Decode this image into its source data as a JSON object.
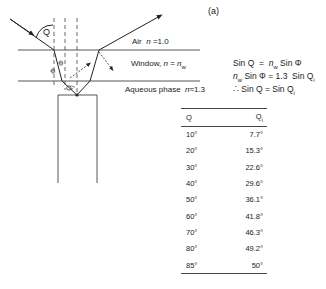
{
  "figure": {
    "panel_label": "(a)",
    "layers": [
      {
        "name": "air",
        "label": "Air  n = 1.0"
      },
      {
        "name": "window",
        "label": "Window,  n = n_w"
      },
      {
        "name": "aqueous",
        "label": "Aqueous phase  n ≈ 1.3"
      }
    ],
    "angle_labels": {
      "incident": "Q",
      "window": "Φ",
      "aqueous": "Q_i"
    }
  },
  "equations": [
    "Sin Q  =  n_w Sin Φ",
    "n_w Sin Φ  =  1.3  Sin Q_i",
    "∴  Sin Q  =  Sin Q_i"
  ],
  "table": {
    "headers": [
      "Q",
      "Q_i"
    ],
    "rows": [
      [
        "10°",
        "7.7°"
      ],
      [
        "20°",
        "15.3°"
      ],
      [
        "30°",
        "22.6°"
      ],
      [
        "40°",
        "29.6°"
      ],
      [
        "50°",
        "36.1°"
      ],
      [
        "60°",
        "41.8°"
      ],
      [
        "70°",
        "46.3°"
      ],
      [
        "80°",
        "49.2°"
      ],
      [
        "85°",
        "50°"
      ]
    ]
  }
}
